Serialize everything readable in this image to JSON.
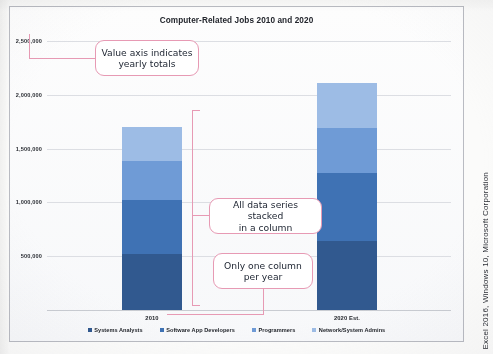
{
  "figure": {
    "credit": "Excel 2016, Windows 10, Microsoft Corporation"
  },
  "chart_data": {
    "type": "bar",
    "subtype": "stacked-column",
    "title": "Computer-Related Jobs 2010 and 2020",
    "xlabel": "",
    "ylabel": "",
    "categories": [
      "2010",
      "2020 Est."
    ],
    "series": [
      {
        "name": "Systems Analysts",
        "values": [
          525000,
          645000
        ],
        "color": "#31598f"
      },
      {
        "name": "Software App Developers",
        "values": [
          500000,
          625000
        ],
        "color": "#3f72b4"
      },
      {
        "name": "Programmers",
        "values": [
          360000,
          420000
        ],
        "color": "#6f9bd6"
      },
      {
        "name": "Network/System Admins",
        "values": [
          320000,
          420000
        ],
        "color": "#9dbce5"
      }
    ],
    "totals": [
      1705000,
      2110000
    ],
    "ylim": [
      0,
      2500000
    ],
    "ytick_values": [
      2500000,
      2000000,
      1500000,
      1000000,
      500000,
      0
    ],
    "ytick_labels": [
      "2,500,000",
      "2,000,000",
      "1,500,000",
      "1,000,000",
      "500,000",
      ""
    ],
    "grid": true,
    "legend_position": "bottom",
    "stack_order_bottom_to_top": [
      "Systems Analysts",
      "Software App Developers",
      "Programmers",
      "Network/System Admins"
    ]
  },
  "annotations": [
    {
      "id": "value-axis",
      "text": "Value axis indicates\nyearly totals"
    },
    {
      "id": "stacked-series",
      "text": "All data series stacked\nin a column"
    },
    {
      "id": "one-column",
      "text": "Only one column\nper year"
    }
  ],
  "colors": {
    "callout_border": "#e79ab4",
    "gridline": "#dcdee3",
    "frame": "#b9bbc2"
  }
}
